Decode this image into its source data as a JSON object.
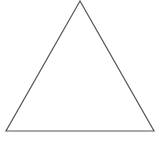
{
  "diagram": {
    "shape": "triangle",
    "kind": "equilateral",
    "vertices": [
      {
        "name": "apex",
        "x": 80,
        "y": 1
      },
      {
        "name": "bottom-left",
        "x": 6,
        "y": 131
      },
      {
        "name": "bottom-right",
        "x": 154,
        "y": 131
      }
    ],
    "stroke_color": "#555555",
    "stroke_width": 1.2,
    "fill_color": "#ffffff",
    "background_color": "#ffffff"
  },
  "watermark": {
    "text": "",
    "color": "#e6e6e6"
  }
}
